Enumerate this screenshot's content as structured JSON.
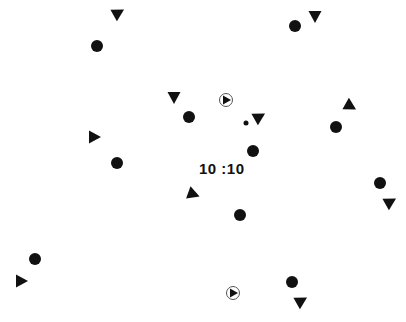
{
  "timer": {
    "text": "10 :10"
  },
  "colors": {
    "shape": "#111111",
    "background": "#ffffff",
    "ring": "#555555"
  },
  "dots": [
    {
      "x": 97,
      "y": 46,
      "r": 6
    },
    {
      "x": 295,
      "y": 26,
      "r": 6
    },
    {
      "x": 189,
      "y": 117,
      "r": 6
    },
    {
      "x": 336,
      "y": 127,
      "r": 6
    },
    {
      "x": 253,
      "y": 151,
      "r": 6
    },
    {
      "x": 117,
      "y": 163,
      "r": 6
    },
    {
      "x": 380,
      "y": 183,
      "r": 6
    },
    {
      "x": 240,
      "y": 215,
      "r": 6
    },
    {
      "x": 35,
      "y": 259,
      "r": 6
    },
    {
      "x": 292,
      "y": 282,
      "r": 6
    },
    {
      "x": 246,
      "y": 123,
      "r": 2.5
    }
  ],
  "triangles": [
    {
      "x": 118,
      "y": 13,
      "rot": -30
    },
    {
      "x": 315,
      "y": 16,
      "rot": 90
    },
    {
      "x": 174,
      "y": 97,
      "rot": 90
    },
    {
      "x": 259,
      "y": 117,
      "rot": -30
    },
    {
      "x": 350,
      "y": 106,
      "rot": 30
    },
    {
      "x": 94,
      "y": 137,
      "rot": 0
    },
    {
      "x": 193,
      "y": 194,
      "rot": 20
    },
    {
      "x": 390,
      "y": 202,
      "rot": -30
    },
    {
      "x": 21,
      "y": 281,
      "rot": 0
    },
    {
      "x": 301,
      "y": 301,
      "rot": -30
    }
  ],
  "targets": [
    {
      "x": 226,
      "y": 100
    },
    {
      "x": 233,
      "y": 293
    }
  ]
}
